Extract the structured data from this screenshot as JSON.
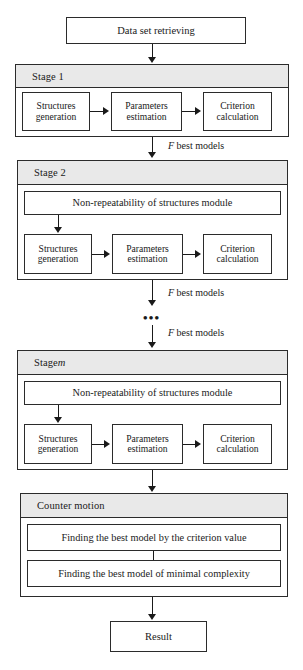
{
  "diagram": {
    "title_box": {
      "label": "Data set retrieving"
    },
    "result_box": {
      "label": "Result"
    },
    "ellipsis": "•••",
    "edge_labels": {
      "stage1_to_stage2": {
        "prefix": "F",
        "text": " best models"
      },
      "stage2_to_dots": {
        "prefix": "F",
        "text": " best models"
      },
      "dots_to_stagem": {
        "prefix": "F",
        "text": " best models"
      }
    },
    "stages": [
      {
        "id": "stage-1",
        "header": "Stage 1",
        "header_suffix": "",
        "has_nonrepeat": false,
        "nonrepeat_label": "",
        "boxes": [
          {
            "id": "structures-generation",
            "line1": "Structures",
            "line2": "generation"
          },
          {
            "id": "parameters-estimation",
            "line1": "Parameters",
            "line2": "estimation"
          },
          {
            "id": "criterion-calculation",
            "line1": "Criterion",
            "line2": "calculation"
          }
        ]
      },
      {
        "id": "stage-2",
        "header": "Stage 2",
        "header_suffix": "",
        "has_nonrepeat": true,
        "nonrepeat_label": "Non-repeatability of structures module",
        "boxes": [
          {
            "id": "structures-generation",
            "line1": "Structures",
            "line2": "generation"
          },
          {
            "id": "parameters-estimation",
            "line1": "Parameters",
            "line2": "estimation"
          },
          {
            "id": "criterion-calculation",
            "line1": "Criterion",
            "line2": "calculation"
          }
        ]
      },
      {
        "id": "stage-m",
        "header": "Stage ",
        "header_suffix": "m",
        "has_nonrepeat": true,
        "nonrepeat_label": "Non-repeatability of structures module",
        "boxes": [
          {
            "id": "structures-generation",
            "line1": "Structures",
            "line2": "generation"
          },
          {
            "id": "parameters-estimation",
            "line1": "Parameters",
            "line2": "estimation"
          },
          {
            "id": "criterion-calculation",
            "line1": "Criterion",
            "line2": "calculation"
          }
        ]
      }
    ],
    "counter_motion": {
      "header": "Counter motion",
      "rows": [
        {
          "id": "finding-best-by-criterion",
          "label": "Finding the best model by the criterion value"
        },
        {
          "id": "finding-best-minimal-complexity",
          "label": "Finding the best model of minimal complexity"
        }
      ]
    },
    "colors": {
      "stroke": "#2b2b2b",
      "header_fill": "#e9e9e9",
      "page_fill": "#ffffff",
      "text": "#1a1a1a"
    }
  }
}
